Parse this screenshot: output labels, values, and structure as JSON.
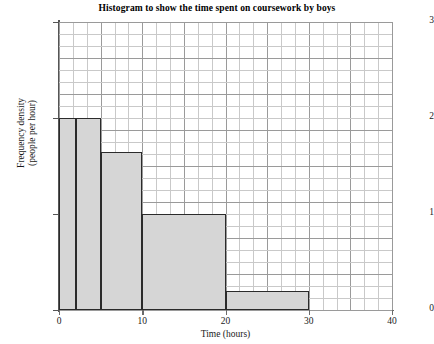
{
  "chart_data": {
    "type": "bar",
    "title": "Histogram to show the time spent on coursework by boys",
    "xlabel": "Time (hours)",
    "ylabel_line1": "Frequency density",
    "ylabel_line2": "(people per hour)",
    "xlim": [
      0,
      40
    ],
    "ylim": [
      0,
      3
    ],
    "xticks": [
      "0",
      "10",
      "20",
      "30",
      "40"
    ],
    "xtick_values": [
      0,
      10,
      20,
      30,
      40
    ],
    "yticks": [
      "0",
      "1",
      "2",
      "3"
    ],
    "ytick_values": [
      0,
      1,
      2,
      3
    ],
    "grid": true,
    "legend": "none",
    "bars": [
      {
        "x_start": 0,
        "x_end": 2,
        "value": 2
      },
      {
        "x_start": 2,
        "x_end": 5,
        "value": 2
      },
      {
        "x_start": 5,
        "x_end": 10,
        "value": 1.65
      },
      {
        "x_start": 10,
        "x_end": 20,
        "value": 1
      },
      {
        "x_start": 20,
        "x_end": 30,
        "value": 0.2
      }
    ],
    "bar_fill_color": "#d6d6d6",
    "bar_edge_color": "#2b2b2b",
    "grid_color": "#c9c9c9"
  }
}
